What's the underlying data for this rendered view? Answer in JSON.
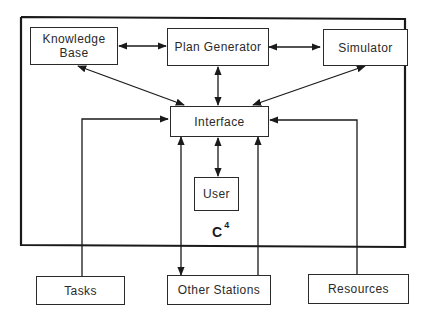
{
  "diagram": {
    "system_label": "C",
    "system_superscript": "4",
    "nodes": {
      "knowledge_base": "Knowledge Base",
      "knowledge_base_line1": "Knowledge",
      "knowledge_base_line2": "Base",
      "plan_generator": "Plan Generator",
      "simulator": "Simulator",
      "interface": "Interface",
      "user": "User",
      "tasks": "Tasks",
      "other_stations": "Other Stations",
      "resources": "Resources"
    },
    "edges": [
      {
        "from": "Knowledge Base",
        "to": "Plan Generator",
        "direction": "bidirectional"
      },
      {
        "from": "Plan Generator",
        "to": "Simulator",
        "direction": "bidirectional"
      },
      {
        "from": "Knowledge Base",
        "to": "Interface",
        "direction": "bidirectional"
      },
      {
        "from": "Plan Generator",
        "to": "Interface",
        "direction": "bidirectional"
      },
      {
        "from": "Simulator",
        "to": "Interface",
        "direction": "bidirectional"
      },
      {
        "from": "Interface",
        "to": "User",
        "direction": "bidirectional"
      },
      {
        "from": "Tasks",
        "to": "Interface",
        "direction": "directed"
      },
      {
        "from": "Resources",
        "to": "Interface",
        "direction": "directed"
      },
      {
        "from": "Other Stations",
        "to": "Interface",
        "direction": "directed"
      },
      {
        "from": "Interface",
        "to": "Other Stations",
        "direction": "directed"
      }
    ]
  }
}
